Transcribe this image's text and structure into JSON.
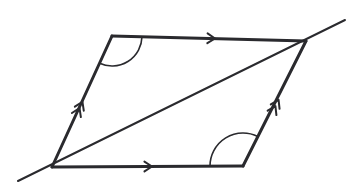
{
  "figure": {
    "shape_type": "parallelogram",
    "background_color": "#ffffff",
    "stroke_color": "#2a2a2e",
    "side_stroke_width": 3,
    "diagonal_stroke_width": 2,
    "arc_stroke_width": 1.6,
    "tick_stroke_width": 2
  },
  "vertices": {
    "top_left": {
      "label": "top-left-vertex",
      "x": 112,
      "y": 36
    },
    "top_right": {
      "label": "top-right-vertex",
      "x": 306,
      "y": 41
    },
    "bottom_right": {
      "label": "bottom-right-vertex",
      "x": 243,
      "y": 166
    },
    "bottom_left": {
      "label": "bottom-left-vertex",
      "x": 52,
      "y": 167
    }
  },
  "sides": [
    {
      "name": "top-side",
      "from": "top_left",
      "to": "top_right",
      "x1": 112,
      "y1": 36,
      "x2": 306,
      "y2": 41,
      "mark_type": "single-chevron",
      "mark_count": 1,
      "mark_x": 215,
      "mark_y": 38.5,
      "mark_angle_deg": 1.5
    },
    {
      "name": "right-side",
      "from": "bottom_right",
      "to": "top_right",
      "x1": 243,
      "y1": 166,
      "x2": 306,
      "y2": 41,
      "mark_type": "double-chevron",
      "mark_count": 2,
      "mark_x": 277,
      "mark_y": 103,
      "mark_angle_deg": -63.3
    },
    {
      "name": "bottom-side",
      "from": "bottom_left",
      "to": "bottom_right",
      "x1": 52,
      "y1": 167,
      "x2": 243,
      "y2": 166,
      "mark_type": "single-chevron",
      "mark_count": 1,
      "mark_x": 152,
      "mark_y": 166.5,
      "mark_angle_deg": -0.3
    },
    {
      "name": "left-side",
      "from": "bottom_left",
      "to": "top_left",
      "x1": 52,
      "y1": 167,
      "x2": 112,
      "y2": 36,
      "mark_type": "double-chevron",
      "mark_count": 2,
      "mark_x": 81,
      "mark_y": 105,
      "mark_angle_deg": -65.4
    }
  ],
  "diagonal": {
    "name": "diagonal-transversal",
    "from": "bottom_left",
    "to": "top_right",
    "x1": 52,
    "y1": 167,
    "x2": 306,
    "y2": 41,
    "extends_beyond_endpoints": true,
    "extension_lower_left": {
      "x": 18,
      "y": 181
    },
    "extension_upper_right": {
      "x": 345,
      "y": 20
    }
  },
  "angle_arcs": [
    {
      "name": "angle-arc-top-left",
      "at_vertex": "top_left",
      "cx": 112,
      "cy": 36,
      "radius": 30,
      "start_angle_deg": 1.5,
      "end_angle_deg": 114.6,
      "between_sides": [
        "top-side",
        "left-side"
      ],
      "interior": true
    },
    {
      "name": "angle-arc-bottom-right",
      "at_vertex": "bottom_right",
      "cx": 243,
      "cy": 166,
      "radius": 33,
      "start_angle_deg": 180.3,
      "end_angle_deg": 296.7,
      "between_sides": [
        "bottom-side",
        "right-side"
      ],
      "interior": true
    }
  ]
}
